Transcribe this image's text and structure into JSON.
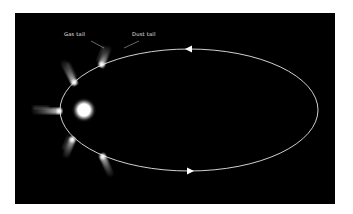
{
  "diagram": {
    "background_color": "#000000",
    "page_color": "#ffffff",
    "labels": {
      "gas_tail": "Gas tail",
      "dust_tail": "Dust tail"
    },
    "sun": {
      "cx": 84,
      "cy": 110,
      "r": 8,
      "color": "#ffffff"
    },
    "orbit": {
      "cx": 189,
      "cy": 110,
      "rx": 129,
      "ry": 61,
      "color": "#e8e8e8",
      "arrows": [
        {
          "x": 188,
          "y": 49,
          "direction": "left"
        },
        {
          "x": 190,
          "y": 171,
          "direction": "right"
        }
      ]
    },
    "comets": [
      {
        "head_x": 101,
        "head_y": 66,
        "tail_x": 109,
        "tail_y": 46
      },
      {
        "head_x": 75,
        "head_y": 84,
        "tail_x": 63,
        "tail_y": 61
      },
      {
        "head_x": 61,
        "head_y": 111,
        "tail_x": 33,
        "tail_y": 111
      },
      {
        "head_x": 73,
        "head_y": 138,
        "tail_x": 65,
        "tail_y": 157
      },
      {
        "head_x": 102,
        "head_y": 155,
        "tail_x": 111,
        "tail_y": 176
      }
    ]
  }
}
